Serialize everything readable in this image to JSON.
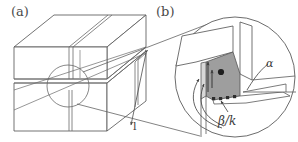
{
  "figure": {
    "background_color": "#ffffff",
    "line_color": "#555555",
    "shade_color": "#9a9a9a",
    "text_color": "#3c3c3c",
    "width": 298,
    "height": 142
  },
  "panels": [
    {
      "id": "a",
      "label": "(a)",
      "description": "Three-dimensional block with intersecting slits; circular callout marks the magnified region.",
      "annotations": [
        {
          "name": "length-label",
          "text": "l",
          "kind": "dimension"
        }
      ]
    },
    {
      "id": "b",
      "label": "(b)",
      "description": "Circular magnified detail of slit intersection showing shaded crack face with traction arrows.",
      "annotations": [
        {
          "name": "alpha-label",
          "text": "α",
          "kind": "angle"
        },
        {
          "name": "beta-over-k-label",
          "text": "β/k",
          "kind": "ratio"
        }
      ]
    }
  ],
  "icons": {
    "callout_circle": "magnifier-circle",
    "arrow": "arrow-head",
    "point_marker": "filled-dot"
  }
}
